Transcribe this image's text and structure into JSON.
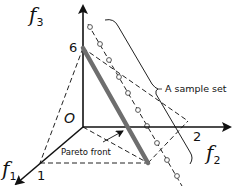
{
  "diagram": {
    "axes": {
      "f1": {
        "name": "f",
        "sub": "1",
        "tick": "1"
      },
      "f2": {
        "name": "f",
        "sub": "2",
        "tick": "2"
      },
      "f3": {
        "name": "f",
        "sub": "3",
        "tick": "6"
      },
      "origin": "O"
    },
    "labels": {
      "sample_set": "A sample set",
      "pareto_front": "Pareto front"
    },
    "colors": {
      "axis": "#111111",
      "pareto_line": "#6e6e6e",
      "dashed": "#222222",
      "marker": "#555555"
    }
  }
}
